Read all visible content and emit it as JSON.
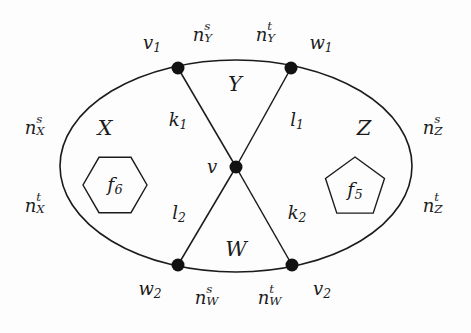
{
  "figure": {
    "type": "planar-graph-diagram",
    "background_color": "#fdfdfd",
    "stroke_color": "#1b1b1b",
    "node_color": "#121212"
  },
  "outer_boundary": {
    "shape": "ellipse",
    "center": [
      236,
      166
    ],
    "radius_x": 176,
    "radius_y": 106
  },
  "vertices": [
    {
      "id": "v1",
      "label": "v",
      "sub": "1",
      "x": 178,
      "y": 68,
      "label_x": 152,
      "label_y": 44
    },
    {
      "id": "w1",
      "label": "w",
      "sub": "1",
      "x": 291,
      "y": 68,
      "label_x": 321,
      "label_y": 44
    },
    {
      "id": "w2",
      "label": "w",
      "sub": "2",
      "x": 178,
      "y": 265,
      "label_x": 150,
      "label_y": 290
    },
    {
      "id": "v2",
      "label": "v",
      "sub": "2",
      "x": 292,
      "y": 265,
      "label_x": 322,
      "label_y": 290
    },
    {
      "id": "v",
      "label": "v",
      "sub": "",
      "x": 236,
      "y": 167,
      "label_x": 212,
      "label_y": 167
    }
  ],
  "edges": [
    {
      "id": "k1",
      "from": "v1",
      "to": "v",
      "label": "k",
      "sub": "1",
      "label_x": 178,
      "label_y": 121
    },
    {
      "id": "l1",
      "from": "w1",
      "to": "v",
      "label": "l",
      "sub": "1",
      "label_x": 297,
      "label_y": 121
    },
    {
      "id": "l2",
      "from": "w2",
      "to": "v",
      "label": "l",
      "sub": "2",
      "label_x": 179,
      "label_y": 214
    },
    {
      "id": "k2",
      "from": "v2",
      "to": "v",
      "label": "k",
      "sub": "2",
      "label_x": 297,
      "label_y": 214
    }
  ],
  "regions": [
    {
      "id": "X",
      "label": "X",
      "label_x": 105,
      "label_y": 128
    },
    {
      "id": "Y",
      "label": "Y",
      "label_x": 235,
      "label_y": 84
    },
    {
      "id": "Z",
      "label": "Z",
      "label_x": 364,
      "label_y": 128
    },
    {
      "id": "W",
      "label": "W",
      "label_x": 236,
      "label_y": 249
    }
  ],
  "arc_labels": [
    {
      "id": "nYs",
      "base": "n",
      "sup": "s",
      "sub": "Y",
      "x": 204,
      "y": 35
    },
    {
      "id": "nYt",
      "base": "n",
      "sup": "t",
      "sub": "Y",
      "x": 267,
      "y": 35
    },
    {
      "id": "nXs",
      "base": "n",
      "sup": "s",
      "sub": "X",
      "x": 36,
      "y": 128
    },
    {
      "id": "nXt",
      "base": "n",
      "sup": "t",
      "sub": "X",
      "x": 36,
      "y": 206
    },
    {
      "id": "nZs",
      "base": "n",
      "sup": "s",
      "sub": "Z",
      "x": 434,
      "y": 128
    },
    {
      "id": "nZt",
      "base": "n",
      "sup": "t",
      "sub": "Z",
      "x": 434,
      "y": 206
    },
    {
      "id": "nWs",
      "base": "n",
      "sup": "s",
      "sub": "W",
      "x": 206,
      "y": 298
    },
    {
      "id": "nWt",
      "base": "n",
      "sup": "t",
      "sub": "W",
      "x": 269,
      "y": 298
    }
  ],
  "faces": [
    {
      "id": "f6",
      "shape": "hexagon",
      "label": "f",
      "sub": "6",
      "center_x": 115,
      "center_y": 185,
      "radius": 32,
      "orientation": "flat-top",
      "points": "147,185 131,212.7 99,212.7 83,185 99,157.3 131,157.3"
    },
    {
      "id": "f5",
      "shape": "pentagon",
      "label": "f",
      "sub": "5",
      "center_x": 355,
      "center_y": 188,
      "radius": 31,
      "orientation": "point-up",
      "points": "355,157 384.5,178.4 373.2,213.1 336.8,213.1 325.5,178.4"
    }
  ]
}
